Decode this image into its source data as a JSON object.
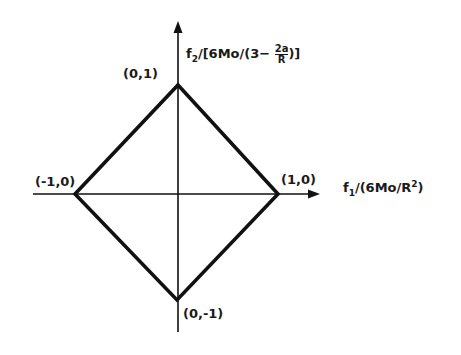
{
  "figure": {
    "type": "rhombus constraint diagram",
    "axes": {
      "horizontal_label": "f₁/(6Mo/R²)",
      "vertical_label": "f₂/[6Mo/(3− 2a/R)]"
    },
    "vertices": [
      {
        "label": "(0,1)",
        "x": 0,
        "y": 1
      },
      {
        "label": "(1,0)",
        "x": 1,
        "y": 0
      },
      {
        "label": "(0,-1)",
        "x": 0,
        "y": -1
      },
      {
        "label": "(-1,0)",
        "x": -1,
        "y": 0
      }
    ],
    "colors": {
      "line": "#111111",
      "background": "#ffffff"
    }
  },
  "labels": {
    "top": "(0,1)",
    "right": "(1,0)",
    "bottom": "(0,-1)",
    "left": "(-1,0)",
    "f1": "f",
    "f1_sub": "1",
    "f1_rest": "/(6Mo/R",
    "f1_sup": "2",
    "f1_close": ")",
    "f2": "f",
    "f2_sub": "2",
    "f2_rest": "/[6Mo/(3− ",
    "f2_frac_num": "2a",
    "f2_frac_den": "R",
    "f2_close": ")]"
  }
}
